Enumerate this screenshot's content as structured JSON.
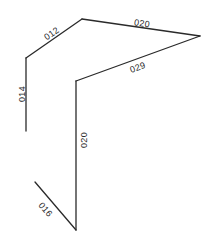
{
  "diagram": {
    "type": "polyline-network",
    "stroke_color": "#2a2a2a",
    "segments": [
      {
        "id": "s014",
        "label": "014",
        "x1": 26,
        "y1": 58,
        "x2": 26,
        "y2": 131,
        "lx": 23,
        "ly": 94,
        "angle": -90
      },
      {
        "id": "s012",
        "label": "012",
        "x1": 26,
        "y1": 58,
        "x2": 82,
        "y2": 19,
        "lx": 52,
        "ly": 34,
        "angle": -35
      },
      {
        "id": "s020a",
        "label": "020",
        "x1": 82,
        "y1": 19,
        "x2": 200,
        "y2": 36,
        "lx": 142,
        "ly": 24,
        "angle": 8
      },
      {
        "id": "s029",
        "label": "029",
        "x1": 200,
        "y1": 36,
        "x2": 76,
        "y2": 81,
        "lx": 138,
        "ly": 68,
        "angle": -20
      },
      {
        "id": "s020b",
        "label": "020",
        "x1": 76,
        "y1": 81,
        "x2": 76,
        "y2": 230,
        "lx": 85,
        "ly": 140,
        "angle": -90
      },
      {
        "id": "s016",
        "label": "016",
        "x1": 35,
        "y1": 182,
        "x2": 76,
        "y2": 230,
        "lx": 45,
        "ly": 210,
        "angle": 50
      }
    ]
  }
}
